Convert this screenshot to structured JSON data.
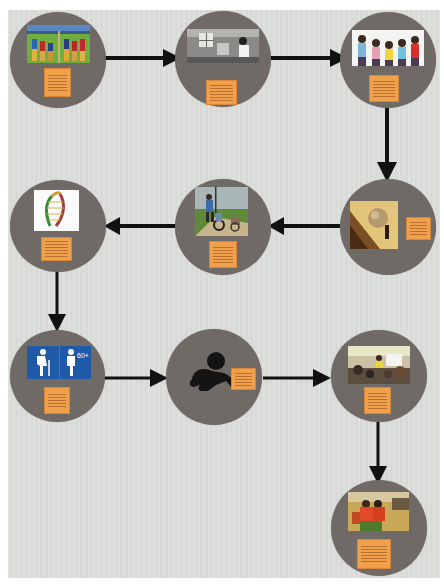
{
  "diagram": {
    "type": "flow",
    "background_color": "#dcdedb",
    "node_color": "#6f6a66",
    "note_color": "#f0a04a",
    "arrow_color": "#111111",
    "nodes": [
      {
        "id": 1,
        "image": "children-painting-mural",
        "note_lines": 6
      },
      {
        "id": 2,
        "image": "black-and-white-classroom-photo",
        "note_lines": 6
      },
      {
        "id": 3,
        "image": "children-with-backpacks-raising-hands",
        "note_lines": 6
      },
      {
        "id": 4,
        "image": "sisyphus-pushing-boulder",
        "note_lines": 6
      },
      {
        "id": 5,
        "image": "people-walking-with-wheelchair",
        "note_lines": 6
      },
      {
        "id": 6,
        "image": "dna-helix-strand",
        "note_lines": 6
      },
      {
        "id": 7,
        "image": "elderly-figures-60-plus-sign",
        "note_lines": 5,
        "sign_text": "60+"
      },
      {
        "id": 8,
        "image": "crawling-baby-silhouette",
        "note_lines": 5
      },
      {
        "id": 9,
        "image": "classroom-with-teacher",
        "note_lines": 6
      },
      {
        "id": 10,
        "image": "children-in-red-shirts-in-cafeteria",
        "note_lines": 6
      }
    ],
    "edges": [
      {
        "from": 1,
        "to": 2,
        "direction": "right"
      },
      {
        "from": 2,
        "to": 3,
        "direction": "right"
      },
      {
        "from": 3,
        "to": 4,
        "direction": "down"
      },
      {
        "from": 4,
        "to": 5,
        "direction": "left"
      },
      {
        "from": 5,
        "to": 6,
        "direction": "left"
      },
      {
        "from": 6,
        "to": 7,
        "direction": "down"
      },
      {
        "from": 7,
        "to": 8,
        "direction": "right"
      },
      {
        "from": 8,
        "to": 9,
        "direction": "right"
      },
      {
        "from": 9,
        "to": 10,
        "direction": "down"
      }
    ]
  }
}
